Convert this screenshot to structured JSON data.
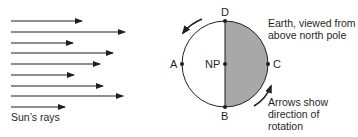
{
  "diagram": {
    "sun_rays": {
      "label": "Sun’s rays",
      "rays": [
        {
          "y": 21,
          "x_end": 82
        },
        {
          "y": 32,
          "x_end": 125
        },
        {
          "y": 43,
          "x_end": 73
        },
        {
          "y": 53,
          "x_end": 113
        },
        {
          "y": 64,
          "x_end": 100
        },
        {
          "y": 75,
          "x_end": 74
        },
        {
          "y": 86,
          "x_end": 103
        },
        {
          "y": 96,
          "x_end": 123
        },
        {
          "y": 107,
          "x_end": 65
        }
      ]
    },
    "earth": {
      "caption_line1": "Earth, viewed from",
      "caption_line2": "above north pole",
      "points": {
        "top": "D",
        "bottom": "B",
        "left": "A",
        "right": "C",
        "center": "NP"
      },
      "lit_color": "#ffffff",
      "shaded_color": "#a8a8a8",
      "shaded_side": "right"
    },
    "rotation_note": {
      "line1": "Arrows show",
      "line2": "direction of",
      "line3": "rotation"
    }
  }
}
